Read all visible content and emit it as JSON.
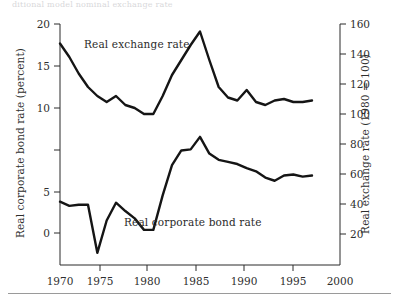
{
  "figure": {
    "top_fragment_text": "ditional model nominal exchange rate",
    "bottom_rule": "horizontal-rule"
  },
  "labels": {
    "exchange_series": "Real exchange rate",
    "bond_series": "Real corporate bond rate",
    "left_axis_title": "Real corporate bond rate (percent)",
    "right_axis_title": "Real exchange rate (1980 = 100)"
  },
  "chart_data": {
    "type": "line",
    "title": "",
    "xlabel": "",
    "ylabel": "Real corporate bond rate (percent)",
    "y2label": "Real exchange rate (1980 = 100)",
    "grid": false,
    "legend": "inline-annotations",
    "xlim": [
      1970,
      2000
    ],
    "ylim": [
      -5,
      20
    ],
    "y2lim": [
      0,
      160
    ],
    "xticks": [
      1970,
      1975,
      1980,
      1985,
      1990,
      1995,
      2000
    ],
    "yticks": [
      0,
      5,
      10,
      15,
      20
    ],
    "y2ticks": [
      20,
      40,
      60,
      80,
      100,
      120,
      140,
      160
    ],
    "series": [
      {
        "name": "Real exchange rate",
        "axis": "right",
        "units": "1980 = 100",
        "x": [
          1970,
          1971,
          1972,
          1973,
          1974,
          1975,
          1976,
          1977,
          1978,
          1979,
          1980,
          1981,
          1982,
          1983,
          1984,
          1985,
          1986,
          1987,
          1988,
          1989,
          1990,
          1991,
          1992,
          1993,
          1994,
          1995,
          1996,
          1997
        ],
        "values": [
          147,
          138,
          127,
          118,
          112,
          108,
          112,
          106,
          104,
          100,
          100,
          112,
          126,
          136,
          146,
          155,
          136,
          118,
          111,
          109,
          116,
          108,
          106,
          109,
          110,
          108,
          108,
          109
        ]
      },
      {
        "name": "Real corporate bond rate",
        "axis": "left",
        "units": "percent",
        "x": [
          1970,
          1971,
          1972,
          1973,
          1974,
          1975,
          1976,
          1977,
          1978,
          1979,
          1980,
          1981,
          1982,
          1983,
          1984,
          1985,
          1986,
          1987,
          1988,
          1989,
          1990,
          1991,
          1992,
          1993,
          1994,
          1995,
          1996,
          1997
        ],
        "values": [
          3.0,
          2.6,
          2.7,
          2.7,
          -1.9,
          1.2,
          2.9,
          2.1,
          1.4,
          0.3,
          0.3,
          3.6,
          6.5,
          7.9,
          8.0,
          9.2,
          7.6,
          7.0,
          6.8,
          6.6,
          6.2,
          5.9,
          5.3,
          5.0,
          5.5,
          5.6,
          5.4,
          5.5
        ]
      }
    ]
  }
}
